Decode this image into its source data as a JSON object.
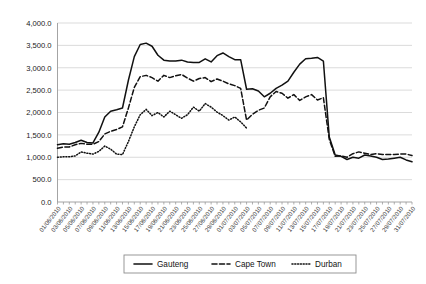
{
  "chart_data": {
    "type": "line",
    "title": "",
    "xlabel": "",
    "ylabel": "",
    "ylim": [
      0,
      4000
    ],
    "grid": true,
    "legend_position": "bottom",
    "y_ticks": [
      "0.0",
      "500.0",
      "1,000.0",
      "1,500.0",
      "2,000.0",
      "2,500.0",
      "3,000.0",
      "3,500.0",
      "4,000.0"
    ],
    "y_tick_values": [
      0,
      500,
      1000,
      1500,
      2000,
      2500,
      3000,
      3500,
      4000
    ],
    "x": [
      "01/06/2010",
      "02/06/2010",
      "03/06/2010",
      "04/06/2010",
      "05/06/2010",
      "06/06/2010",
      "07/06/2010",
      "08/06/2010",
      "09/06/2010",
      "10/06/2010",
      "11/06/2010",
      "12/06/2010",
      "13/06/2010",
      "14/06/2010",
      "15/06/2010",
      "16/06/2010",
      "17/06/2010",
      "18/06/2010",
      "19/06/2010",
      "20/06/2010",
      "21/06/2010",
      "22/06/2010",
      "23/06/2010",
      "24/06/2010",
      "25/06/2010",
      "26/06/2010",
      "27/06/2010",
      "28/06/2010",
      "29/06/2010",
      "30/06/2010",
      "01/07/2010",
      "02/07/2010",
      "03/07/2010",
      "04/07/2010",
      "05/07/2010",
      "06/07/2010",
      "07/07/2010",
      "08/07/2010",
      "09/07/2010",
      "10/07/2010",
      "11/07/2010",
      "12/07/2010",
      "13/07/2010",
      "14/07/2010",
      "15/07/2010",
      "16/07/2010",
      "17/07/2010",
      "18/07/2010",
      "19/07/2010",
      "20/07/2010",
      "21/07/2010",
      "22/07/2010",
      "23/07/2010",
      "24/07/2010",
      "25/07/2010",
      "26/07/2010",
      "27/07/2010",
      "28/07/2010",
      "29/07/2010",
      "30/07/2010",
      "31/07/2010"
    ],
    "x_tick_labels": [
      "01/06/2010",
      "03/06/2010",
      "05/06/2010",
      "07/06/2010",
      "09/06/2010",
      "11/06/2010",
      "13/06/2010",
      "15/06/2010",
      "17/06/2010",
      "19/06/2010",
      "21/06/2010",
      "23/06/2010",
      "25/06/2010",
      "27/06/2010",
      "29/06/2010",
      "01/07/2010",
      "03/07/2010",
      "05/07/2010",
      "07/07/2010",
      "09/07/2010",
      "11/07/2010",
      "13/07/2010",
      "15/07/2010",
      "17/07/2010",
      "19/07/2010",
      "21/07/2010",
      "23/07/2010",
      "25/07/2010",
      "27/07/2010",
      "29/07/2010",
      "31/07/2010"
    ],
    "series": [
      {
        "name": "Gauteng",
        "style": "solid",
        "values": [
          1280,
          1300,
          1290,
          1330,
          1380,
          1330,
          1320,
          1560,
          1900,
          2030,
          2060,
          2100,
          2720,
          3250,
          3520,
          3550,
          3480,
          3280,
          3170,
          3150,
          3150,
          3170,
          3130,
          3120,
          3120,
          3200,
          3130,
          3270,
          3330,
          3250,
          3180,
          3180,
          2520,
          2530,
          2480,
          2350,
          2430,
          2540,
          2610,
          2700,
          2900,
          3080,
          3200,
          3210,
          3230,
          3150,
          1450,
          1050,
          1020,
          950,
          1000,
          980,
          1050,
          1030,
          1000,
          950,
          960,
          980,
          1000,
          940,
          900
        ]
      },
      {
        "name": "Cape Town",
        "style": "dashed",
        "values": [
          1200,
          1230,
          1230,
          1280,
          1310,
          1290,
          1290,
          1350,
          1520,
          1580,
          1620,
          1680,
          2100,
          2560,
          2800,
          2830,
          2780,
          2700,
          2830,
          2780,
          2820,
          2850,
          2770,
          2700,
          2760,
          2780,
          2690,
          2750,
          2700,
          2640,
          2600,
          2540,
          1830,
          1960,
          2050,
          2100,
          2350,
          2470,
          2430,
          2320,
          2400,
          2270,
          2350,
          2400,
          2280,
          2330,
          1400,
          1020,
          1030,
          1000,
          1080,
          1120,
          1090,
          1060,
          1080,
          1060,
          1060,
          1060,
          1070,
          1070,
          1040
        ]
      },
      {
        "name": "Durban",
        "style": "dotted",
        "values": [
          1000,
          1010,
          1010,
          1030,
          1120,
          1090,
          1070,
          1130,
          1250,
          1180,
          1070,
          1060,
          1350,
          1680,
          1950,
          2070,
          1930,
          2000,
          1900,
          2030,
          1950,
          1870,
          1950,
          2120,
          2030,
          2200,
          2120,
          2010,
          1930,
          1830,
          1900,
          1790,
          1650,
          null,
          null,
          null,
          null,
          null,
          null,
          null,
          null,
          null,
          null,
          null,
          null,
          null,
          null,
          null,
          null,
          null,
          null,
          null,
          null,
          null,
          null,
          null,
          null,
          null,
          null,
          null,
          null
        ]
      }
    ]
  },
  "legend": {
    "items": [
      {
        "label": "Gauteng",
        "style": "solid"
      },
      {
        "label": "Cape Town",
        "style": "dashed"
      },
      {
        "label": "Durban",
        "style": "dotted"
      }
    ]
  },
  "colors": {
    "series": "#111111",
    "grid": "#d2d2d2",
    "axis": "#9a9a9a",
    "background": "#ffffff"
  }
}
